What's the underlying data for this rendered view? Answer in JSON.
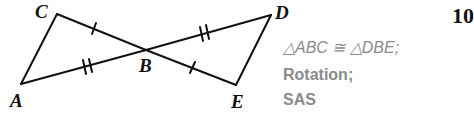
{
  "problem_number": "10",
  "figure": {
    "points": {
      "A": {
        "label": "A",
        "x": 21,
        "y": 84
      },
      "B": {
        "label": "B",
        "x": 146,
        "y": 50
      },
      "C": {
        "label": "C",
        "x": 57,
        "y": 14
      },
      "D": {
        "label": "D",
        "x": 271,
        "y": 15
      },
      "E": {
        "label": "E",
        "x": 236,
        "y": 85
      }
    },
    "tick_marks": {
      "CB": 1,
      "BE": 1,
      "AB": 2,
      "BD": 2
    },
    "line_color": "#111111"
  },
  "answer": {
    "line1": "△ABC ≅ △DBE;",
    "line2": "Rotation;",
    "line3": "SAS",
    "color": "#8a8a8a"
  }
}
